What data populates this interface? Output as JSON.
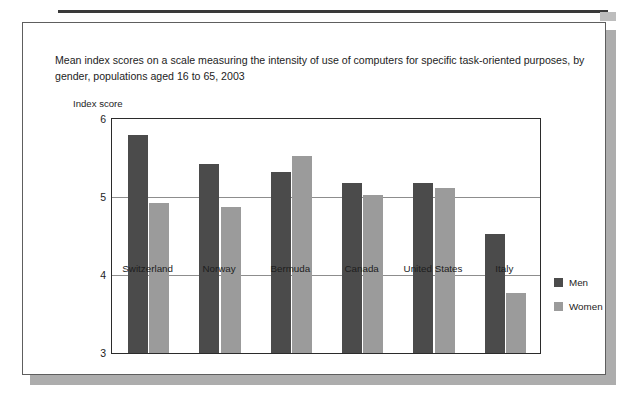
{
  "page": {
    "background_color": "#ffffff",
    "card_border_color": "#5e5e5e",
    "card_shadow_color": "#adadad",
    "top_rule_color": "#3a3a3a"
  },
  "chart_data": {
    "type": "bar",
    "title": "Mean index scores on a scale measuring the intensity of use of computers for specific task-oriented purposes, by gender, populations aged 16 to 65, 2003",
    "xlabel": "",
    "ylabel": "Index score",
    "ylim": [
      3,
      6
    ],
    "yticks": [
      3,
      4,
      5,
      6
    ],
    "ytick_labels": [
      "3",
      "4",
      "5",
      "6"
    ],
    "grid": true,
    "legend_position": "right",
    "categories": [
      "Switzerland",
      "Norway",
      "Bermuda",
      "Canada",
      "United States",
      "Italy"
    ],
    "series": [
      {
        "name": "Men",
        "color": "#4b4b4b",
        "values": [
          5.79,
          5.42,
          5.32,
          5.18,
          5.18,
          4.52
        ]
      },
      {
        "name": "Women",
        "color": "#9b9b9b",
        "values": [
          4.92,
          4.87,
          5.52,
          5.02,
          5.12,
          3.77
        ]
      }
    ]
  }
}
